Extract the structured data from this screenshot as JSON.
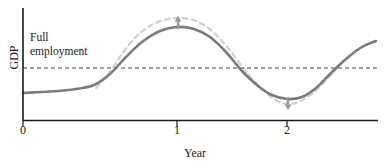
{
  "chart_data": {
    "type": "line",
    "title": "",
    "subtitle": "",
    "xlabel": "Year",
    "ylabel": "GDP",
    "xlim": [
      -0.15,
      2.3
    ],
    "ylim": [
      0,
      1
    ],
    "grid": false,
    "legend_position": "none",
    "xticks": [
      {
        "value": 0,
        "label": "0",
        "px": 23
      },
      {
        "value": 1,
        "label": "1",
        "px": 177
      },
      {
        "value": 2,
        "label": "2",
        "px": 287
      }
    ],
    "yticks": [],
    "reference_lines": [
      {
        "name": "full-employment",
        "label_line1": "Full",
        "label_line2": "employment",
        "orientation": "horizontal",
        "y_px": 68,
        "style": "dashed",
        "color": "#444444"
      }
    ],
    "series": [
      {
        "name": "actual-gdp",
        "style": "solid",
        "color": "#7b7b7b",
        "width": 2.6,
        "points_px": [
          [
            23,
            93
          ],
          [
            40,
            92
          ],
          [
            58,
            91
          ],
          [
            76,
            89
          ],
          [
            94,
            85
          ],
          [
            110,
            74
          ],
          [
            126,
            57
          ],
          [
            142,
            42
          ],
          [
            160,
            31
          ],
          [
            177,
            27
          ],
          [
            194,
            29
          ],
          [
            210,
            37
          ],
          [
            226,
            52
          ],
          [
            242,
            71
          ],
          [
            258,
            86
          ],
          [
            272,
            95
          ],
          [
            287,
            99
          ],
          [
            302,
            97
          ],
          [
            316,
            88
          ],
          [
            330,
            74
          ],
          [
            346,
            59
          ],
          [
            362,
            47
          ],
          [
            376,
            41
          ]
        ]
      },
      {
        "name": "amplified-gdp",
        "style": "dashed",
        "color": "#cfcfcf",
        "width": 2.2,
        "points_px": [
          [
            96,
            88
          ],
          [
            110,
            72
          ],
          [
            124,
            51
          ],
          [
            140,
            33
          ],
          [
            158,
            22
          ],
          [
            177,
            18
          ],
          [
            196,
            21
          ],
          [
            212,
            31
          ],
          [
            228,
            48
          ],
          [
            244,
            69
          ],
          [
            260,
            87
          ],
          [
            274,
            99
          ],
          [
            287,
            104
          ],
          [
            301,
            101
          ],
          [
            315,
            91
          ],
          [
            330,
            76
          ],
          [
            344,
            61
          ],
          [
            356,
            50
          ]
        ]
      }
    ],
    "annotations": [
      {
        "name": "peak-up-arrow",
        "direction": "up",
        "x_px": 178,
        "y_top_px": 16,
        "y_bottom_px": 29,
        "color": "#9a9a9a"
      },
      {
        "name": "trough-down-arrow",
        "direction": "down",
        "x_px": 288,
        "y_top_px": 97,
        "y_bottom_px": 110,
        "color": "#9a9a9a"
      }
    ],
    "axis_color": "#1a1a1a",
    "background_color": "#ffffff"
  },
  "labels": {
    "ylabel": "GDP",
    "xlabel": "Year",
    "full_employment_line1": "Full",
    "full_employment_line2": "employment",
    "tick_0": "0",
    "tick_1": "1",
    "tick_2": "2"
  }
}
